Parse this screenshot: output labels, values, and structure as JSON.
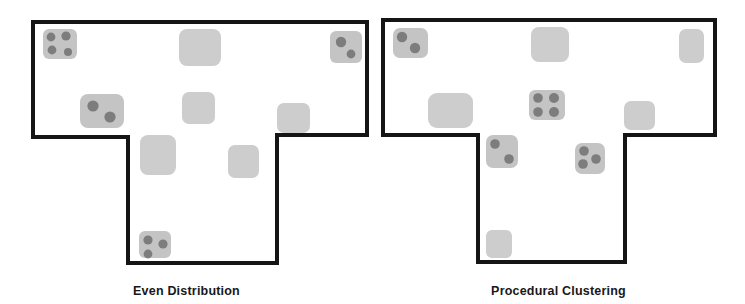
{
  "figure": {
    "background_color": "#ffffff",
    "outline_color": "#151515",
    "outline_width": 4,
    "room_empty_color": "#cdcdcd",
    "room_occupied_color": "#c4c4c4",
    "agent_color": "#7d7d7d",
    "caption_color": "#181818"
  },
  "panels": [
    {
      "id": "even-distribution",
      "caption": "Even Distribution",
      "floor_outline": "M 33 22 L 367 22 L 367 135 L 277 135 L 277 263 L 128 263 L 128 137 L 33 137 Z",
      "rooms": [
        {
          "name": "room-top-left",
          "x": 43,
          "y": 29,
          "w": 34,
          "h": 30,
          "r": 6,
          "agents": [
            {
              "cx": 51,
              "cy": 37,
              "r": 4.4
            },
            {
              "cx": 66,
              "cy": 36,
              "r": 4.6
            },
            {
              "cx": 52,
              "cy": 50,
              "r": 4.4
            },
            {
              "cx": 68,
              "cy": 52,
              "r": 4.0
            }
          ]
        },
        {
          "name": "room-top-center",
          "x": 179,
          "y": 29,
          "w": 42,
          "h": 37,
          "r": 8,
          "agents": []
        },
        {
          "name": "room-top-right",
          "x": 330,
          "y": 31,
          "w": 32,
          "h": 32,
          "r": 6,
          "agents": [
            {
              "cx": 341,
              "cy": 42,
              "r": 5.2
            },
            {
              "cx": 351,
              "cy": 54,
              "r": 4.4
            }
          ]
        },
        {
          "name": "room-mid-left",
          "x": 80,
          "y": 94,
          "w": 44,
          "h": 34,
          "r": 8,
          "agents": [
            {
              "cx": 93,
              "cy": 106,
              "r": 5.6
            },
            {
              "cx": 110,
              "cy": 117,
              "r": 5.6
            }
          ]
        },
        {
          "name": "room-mid-center",
          "x": 182,
          "y": 92,
          "w": 33,
          "h": 32,
          "r": 7,
          "agents": []
        },
        {
          "name": "room-mid-right",
          "x": 277,
          "y": 103,
          "w": 33,
          "h": 30,
          "r": 7,
          "agents": []
        },
        {
          "name": "room-lower-left",
          "x": 140,
          "y": 135,
          "w": 36,
          "h": 40,
          "r": 8,
          "agents": []
        },
        {
          "name": "room-lower-center",
          "x": 228,
          "y": 145,
          "w": 31,
          "h": 33,
          "r": 7,
          "agents": []
        },
        {
          "name": "room-bottom",
          "x": 139,
          "y": 231,
          "w": 32,
          "h": 27,
          "r": 6,
          "agents": [
            {
              "cx": 148,
              "cy": 240,
              "r": 4.6
            },
            {
              "cx": 163,
              "cy": 244,
              "r": 4.6
            },
            {
              "cx": 148,
              "cy": 254,
              "r": 4.4
            }
          ]
        }
      ]
    },
    {
      "id": "procedural-clustering",
      "caption": "Procedural Clustering",
      "floor_outline": "M 11 20 L 343 20 L 343 135 L 253 135 L 253 262 L 106 262 L 106 135 L 11 135 Z",
      "rooms": [
        {
          "name": "room-top-left",
          "x": 21,
          "y": 28,
          "w": 35,
          "h": 30,
          "r": 7,
          "agents": [
            {
              "cx": 30,
              "cy": 37,
              "r": 5.2
            },
            {
              "cx": 43,
              "cy": 48,
              "r": 5.2
            }
          ]
        },
        {
          "name": "room-top-center",
          "x": 159,
          "y": 27,
          "w": 38,
          "h": 35,
          "r": 8,
          "agents": []
        },
        {
          "name": "room-top-right",
          "x": 307,
          "y": 29,
          "w": 25,
          "h": 34,
          "r": 7,
          "agents": []
        },
        {
          "name": "room-mid-left",
          "x": 56,
          "y": 93,
          "w": 45,
          "h": 35,
          "r": 9,
          "agents": []
        },
        {
          "name": "room-mid-center",
          "x": 157,
          "y": 90,
          "w": 36,
          "h": 30,
          "r": 6,
          "agents": [
            {
              "cx": 166,
              "cy": 98,
              "r": 4.8
            },
            {
              "cx": 182,
              "cy": 98,
              "r": 5.0
            },
            {
              "cx": 166,
              "cy": 112,
              "r": 4.8
            },
            {
              "cx": 182,
              "cy": 112,
              "r": 5.0
            }
          ]
        },
        {
          "name": "room-mid-right",
          "x": 252,
          "y": 101,
          "w": 31,
          "h": 29,
          "r": 7,
          "agents": []
        },
        {
          "name": "room-lower-left",
          "x": 114,
          "y": 135,
          "w": 32,
          "h": 33,
          "r": 7,
          "agents": [
            {
              "cx": 123,
              "cy": 144,
              "r": 4.8
            },
            {
              "cx": 137,
              "cy": 159,
              "r": 4.8
            }
          ]
        },
        {
          "name": "room-lower-center",
          "x": 203,
          "y": 143,
          "w": 30,
          "h": 31,
          "r": 7,
          "agents": [
            {
              "cx": 212,
              "cy": 151,
              "r": 4.8
            },
            {
              "cx": 224,
              "cy": 159,
              "r": 4.8
            },
            {
              "cx": 211,
              "cy": 164,
              "r": 4.8
            }
          ]
        },
        {
          "name": "room-bottom",
          "x": 114,
          "y": 230,
          "w": 26,
          "h": 28,
          "r": 6,
          "agents": []
        }
      ]
    }
  ]
}
